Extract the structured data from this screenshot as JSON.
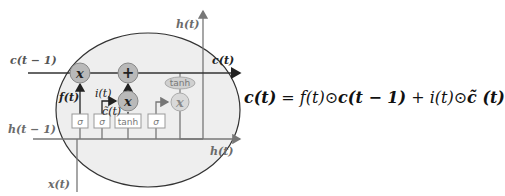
{
  "diagram": {
    "type": "LSTM cell",
    "labels": {
      "c_prev": "c(t − 1)",
      "c_out": "c(t)",
      "h_top": "h(t)",
      "h_prev": "h(t − 1)",
      "h_out": "h(t)",
      "x_in": "x(t)",
      "f_gate": "f(t)",
      "i_gate": "i(t)",
      "c_tilde": "c̃(t)"
    },
    "gates": [
      {
        "label": "σ"
      },
      {
        "label": "σ"
      },
      {
        "label": "tanh"
      },
      {
        "label": "σ"
      }
    ],
    "ops": {
      "forget_mul": "x",
      "add": "+",
      "input_mul": "x",
      "output_mul": "x",
      "output_tanh": "tanh"
    },
    "colors": {
      "cell_fill": "#eeeeee",
      "cell_stroke": "#333333",
      "op_fill": "#b9b9b9",
      "op_light_fill": "#d9d9d9",
      "line": "#777777",
      "c_line": "#333333"
    }
  },
  "equation": {
    "lhs": "c(t)",
    "eq": " = ",
    "f": "f(t)",
    "odot1": "⊙",
    "c_prev": "c(t − 1)",
    "plus": " + ",
    "i": "i(t)",
    "odot2": "⊙",
    "c_tilde": "c̃ (t)"
  }
}
